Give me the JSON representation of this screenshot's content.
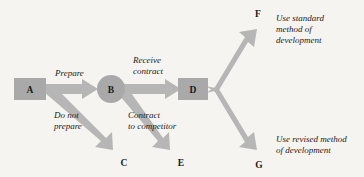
{
  "diagram": {
    "type": "decision-tree",
    "title": "",
    "colors": {
      "background": "#f6f4f1",
      "node_fill": "#a9a9a9",
      "arrow_fill": "#b6b6b6",
      "text": "#1a1a1a"
    },
    "nodes": [
      {
        "id": "A",
        "label": "A",
        "shape": "rect",
        "x": 30,
        "y": 89
      },
      {
        "id": "B",
        "label": "B",
        "shape": "circle",
        "x": 111,
        "y": 89
      },
      {
        "id": "D",
        "label": "D",
        "shape": "rect",
        "x": 193,
        "y": 89
      },
      {
        "id": "C",
        "label": "C",
        "shape": "terminal",
        "x": 124,
        "y": 155
      },
      {
        "id": "E",
        "label": "E",
        "shape": "terminal",
        "x": 178,
        "y": 155
      },
      {
        "id": "F",
        "label": "F",
        "shape": "terminal",
        "x": 258,
        "y": 15
      },
      {
        "id": "G",
        "label": "G",
        "shape": "terminal",
        "x": 258,
        "y": 165
      }
    ],
    "edges": [
      {
        "from": "A",
        "to": "B",
        "label_lines": [
          "Prepare"
        ]
      },
      {
        "from": "A",
        "to": "C",
        "label_lines": [
          "Do not",
          "prepare"
        ]
      },
      {
        "from": "B",
        "to": "D",
        "label_lines": [
          "Receive",
          "contract"
        ]
      },
      {
        "from": "B",
        "to": "E",
        "label_lines": [
          "Contract",
          "to competitor"
        ]
      },
      {
        "from": "D",
        "to": "F",
        "label_lines": []
      },
      {
        "from": "D",
        "to": "G",
        "label_lines": []
      }
    ],
    "edge_labels": {
      "prepare": "Prepare",
      "do_not_prepare_line1": "Do not",
      "do_not_prepare_line2": "prepare",
      "receive_line1": "Receive",
      "receive_line2": "contract",
      "competitor_line1": "Contract",
      "competitor_line2": "to competitor"
    },
    "outcomes": [
      {
        "node": "F",
        "lines": [
          "Use standard",
          "method of",
          "development"
        ]
      },
      {
        "node": "G",
        "lines": [
          "Use revised method",
          "of development"
        ]
      }
    ],
    "outcome_text": {
      "f_line1": "Use standard",
      "f_line2": "method of",
      "f_line3": "development",
      "g_line1": "Use revised method",
      "g_line2": "of development"
    },
    "node_letters": {
      "a": "A",
      "b": "B",
      "c": "C",
      "d": "D",
      "e": "E",
      "f": "F",
      "g": "G"
    }
  }
}
